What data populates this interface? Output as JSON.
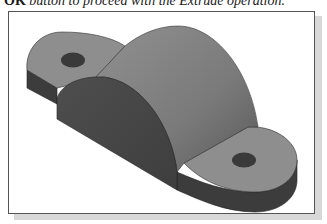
{
  "caption": {
    "prefix": "OK",
    "text": " button to proceed with the Extrude operation."
  },
  "figure": {
    "colors": {
      "frame_border": "#555555",
      "shadow": "#d8d8d8",
      "top_surface": "#8e8e8e",
      "cylinder_top": "#7d7d7d",
      "front_face": "#4a4a4a",
      "side_face": "#3f3f3f",
      "hole": "#3a3a3a"
    }
  }
}
